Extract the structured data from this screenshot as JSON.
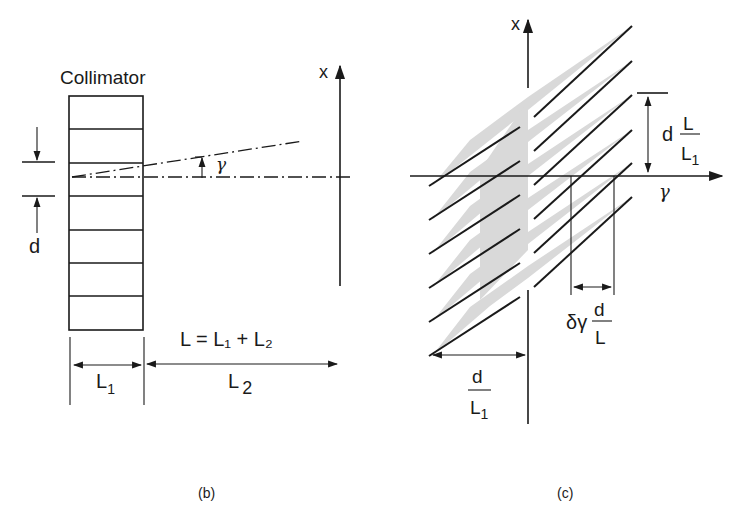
{
  "panel_b": {
    "caption": "(b)",
    "collimator_label": "Collimator",
    "x_axis_label": "x",
    "angle_label": "γ",
    "spacing_label": "d",
    "length_equation": "L = L₁ + L₂",
    "l1_label": "L",
    "l1_sub": "1",
    "l2_label": "L",
    "l2_sub": "2",
    "collimator_cells": 7
  },
  "panel_c": {
    "caption": "(c)",
    "x_axis_label": "x",
    "gamma_axis_label": "γ",
    "period_label": {
      "prefix": "d",
      "numerator": "L",
      "denominator": "L",
      "denominator_sub": "1"
    },
    "resolution_label": {
      "prefix": "δγ",
      "numerator": "d",
      "denominator": "L"
    },
    "width_label": {
      "numerator": "d",
      "denominator": "L",
      "denominator_sub": "1"
    },
    "stripe_count": 6,
    "wedge_color": "#d9d9d9"
  }
}
